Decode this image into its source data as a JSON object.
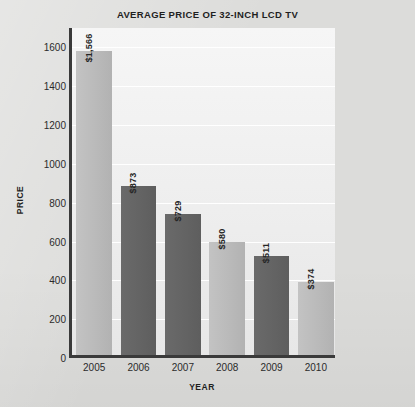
{
  "chart_data": {
    "type": "bar",
    "title": "AVERAGE PRICE OF 32-INCH LCD TV",
    "xlabel": "YEAR",
    "ylabel": "PRICE",
    "categories": [
      "2005",
      "2006",
      "2007",
      "2008",
      "2009",
      "2010"
    ],
    "values": [
      1566,
      873,
      729,
      580,
      511,
      374
    ],
    "value_labels": [
      "$1,566",
      "$873",
      "$729",
      "$580",
      "$511",
      "$374"
    ],
    "bar_colors": [
      "#bdbdbd",
      "#646464",
      "#646464",
      "#bdbdbd",
      "#646464",
      "#bdbdbd"
    ],
    "bar_shades": [
      "light",
      "dark",
      "dark",
      "light",
      "dark",
      "light"
    ],
    "ylim": [
      0,
      1700
    ],
    "yticks": [
      0,
      200,
      400,
      600,
      800,
      1000,
      1200,
      1400,
      1600
    ],
    "ytick_labels": [
      "0",
      "200",
      "400",
      "600",
      "800",
      "1000",
      "1200",
      "1400",
      "1600"
    ],
    "grid": "horizontal",
    "legend": "none",
    "label_rotation": 90,
    "plot_background": "#efefef",
    "gridline_color": "#ffffff",
    "axis_color": "#3a3a3a",
    "page_background": "#dcdcda",
    "title_color": "#1f1f1f"
  }
}
